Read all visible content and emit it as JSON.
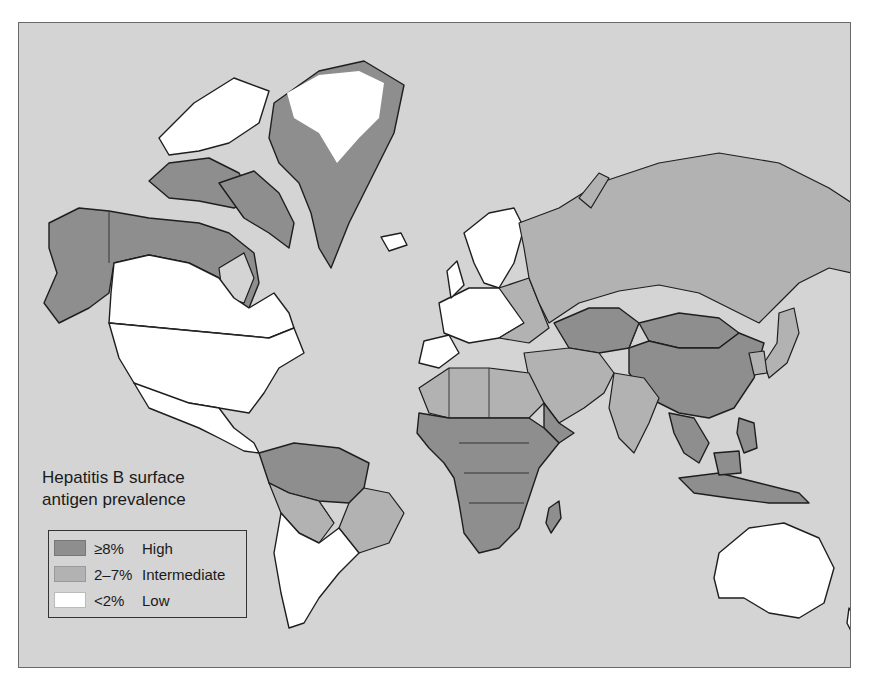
{
  "legend": {
    "title_line1": "Hepatitis B surface",
    "title_line2": "antigen prevalence",
    "items": [
      {
        "range": "≥8%",
        "label": "High",
        "color": "#8e8e8e"
      },
      {
        "range": "2–7%",
        "label": "Intermediate",
        "color": "#b2b2b2"
      },
      {
        "range": "<2%",
        "label": "Low",
        "color": "#ffffff"
      }
    ]
  },
  "colors": {
    "ocean": "#d4d4d4",
    "high": "#8e8e8e",
    "intermediate": "#b2b2b2",
    "low": "#ffffff",
    "outline": "#1e1e1e"
  }
}
